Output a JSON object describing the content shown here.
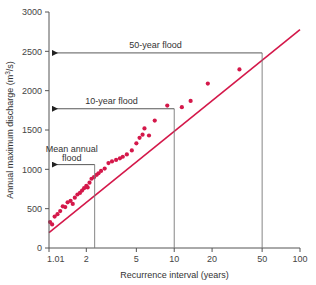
{
  "chart_data": {
    "type": "scatter",
    "title": "",
    "xlabel": "Recurrence interval (years)",
    "ylabel": "Annual maximum discharge (m³/s)",
    "ylabel_main": "Annual maximum discharge (m",
    "ylabel_sup": "3",
    "ylabel_tail": "/s)",
    "x_scale": "log",
    "y_scale": "linear",
    "xlim": [
      1.01,
      100
    ],
    "ylim": [
      0,
      3000
    ],
    "grid": false,
    "legend": "none",
    "x_ticks": [
      "1.01",
      "2",
      "5",
      "10",
      "20",
      "50",
      "100"
    ],
    "x_tick_values": [
      1.01,
      2,
      5,
      10,
      20,
      50,
      100
    ],
    "y_ticks": [
      "0",
      "500",
      "1000",
      "1500",
      "2000",
      "2500",
      "3000"
    ],
    "y_tick_values": [
      0,
      500,
      1000,
      1500,
      2000,
      2500,
      3000
    ],
    "point_color": "#d4184a",
    "line_color": "#d4184a",
    "points": [
      {
        "x": 1.03,
        "y": 330
      },
      {
        "x": 1.07,
        "y": 300
      },
      {
        "x": 1.12,
        "y": 400
      },
      {
        "x": 1.18,
        "y": 430
      },
      {
        "x": 1.24,
        "y": 470
      },
      {
        "x": 1.3,
        "y": 530
      },
      {
        "x": 1.36,
        "y": 520
      },
      {
        "x": 1.42,
        "y": 580
      },
      {
        "x": 1.5,
        "y": 600
      },
      {
        "x": 1.56,
        "y": 560
      },
      {
        "x": 1.62,
        "y": 640
      },
      {
        "x": 1.7,
        "y": 680
      },
      {
        "x": 1.78,
        "y": 700
      },
      {
        "x": 1.85,
        "y": 730
      },
      {
        "x": 1.92,
        "y": 760
      },
      {
        "x": 2.0,
        "y": 790
      },
      {
        "x": 2.05,
        "y": 770
      },
      {
        "x": 2.12,
        "y": 830
      },
      {
        "x": 2.2,
        "y": 880
      },
      {
        "x": 2.3,
        "y": 900
      },
      {
        "x": 2.42,
        "y": 930
      },
      {
        "x": 2.5,
        "y": 950
      },
      {
        "x": 2.62,
        "y": 980
      },
      {
        "x": 2.8,
        "y": 1010
      },
      {
        "x": 3.0,
        "y": 1080
      },
      {
        "x": 3.2,
        "y": 1100
      },
      {
        "x": 3.45,
        "y": 1120
      },
      {
        "x": 3.7,
        "y": 1140
      },
      {
        "x": 3.9,
        "y": 1160
      },
      {
        "x": 4.2,
        "y": 1190
      },
      {
        "x": 4.6,
        "y": 1240
      },
      {
        "x": 5.0,
        "y": 1330
      },
      {
        "x": 5.3,
        "y": 1400
      },
      {
        "x": 5.6,
        "y": 1440
      },
      {
        "x": 5.8,
        "y": 1520
      },
      {
        "x": 6.3,
        "y": 1430
      },
      {
        "x": 7.0,
        "y": 1620
      },
      {
        "x": 8.8,
        "y": 1810
      },
      {
        "x": 11.5,
        "y": 1790
      },
      {
        "x": 13.5,
        "y": 1870
      },
      {
        "x": 18.5,
        "y": 2090
      },
      {
        "x": 33.0,
        "y": 2270
      }
    ],
    "trend_line": {
      "x_start": 1.01,
      "y_start": 195,
      "x_end": 100,
      "y_end": 2775
    },
    "annotations": [
      {
        "name": "fifty-year-flood",
        "label": "50-year flood",
        "recurrence": 50,
        "discharge": 2480,
        "has_vertical_line": true,
        "has_arrow": true
      },
      {
        "name": "ten-year-flood",
        "label": "10-year flood",
        "recurrence": 10,
        "discharge": 1770,
        "has_vertical_line": true,
        "has_arrow": true
      },
      {
        "name": "mean-annual-flood",
        "label_line1": "Mean annual",
        "label_line2": "flood",
        "label": "Mean annual flood",
        "recurrence": 2.33,
        "discharge": 1060,
        "has_vertical_line": true,
        "has_arrow": true
      }
    ]
  }
}
